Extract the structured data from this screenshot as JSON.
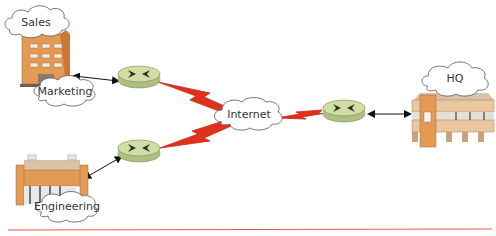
{
  "diagram": {
    "type": "network-topology",
    "colors": {
      "wan_link": "#e0311e",
      "router_fill": "#c9d9a0",
      "router_top": "#d8e6b4",
      "router_mark": "#3b2a1a",
      "building_orange": "#e39a55",
      "building_dark": "#c9783a",
      "building_tan": "#d8b892",
      "cloud_stroke": "#666666",
      "baseline": "#e25d45"
    },
    "sites": {
      "sales_marketing": {
        "clouds": [
          "Sales",
          "Marketing"
        ]
      },
      "engineering": {
        "clouds": [
          "Engineering"
        ]
      },
      "hq": {
        "clouds": [
          "HQ"
        ]
      }
    },
    "internet": {
      "label": "Internet"
    },
    "routers": [
      {
        "id": "router-sales",
        "icon": "router-icon"
      },
      {
        "id": "router-engineering",
        "icon": "router-icon"
      },
      {
        "id": "router-hq",
        "icon": "router-icon"
      }
    ],
    "links": [
      {
        "from": "building-sales",
        "to": "router-sales",
        "type": "lan-bidirectional"
      },
      {
        "from": "building-engineering",
        "to": "router-engineering",
        "type": "lan-bidirectional"
      },
      {
        "from": "router-hq",
        "to": "building-hq",
        "type": "lan-bidirectional"
      },
      {
        "from": "router-sales",
        "to": "internet",
        "type": "wan-lightning"
      },
      {
        "from": "router-engineering",
        "to": "internet",
        "type": "wan-lightning"
      },
      {
        "from": "internet",
        "to": "router-hq",
        "type": "wan-lightning"
      }
    ]
  }
}
